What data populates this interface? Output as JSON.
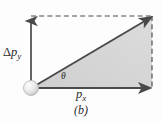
{
  "figure": {
    "caption": "(b)",
    "background_color": "#fdfdfd",
    "width": 162,
    "height": 122
  },
  "labels": {
    "vertical_component": {
      "delta": "Δ",
      "symbol": "p",
      "subscript": "y",
      "full": "Δp_y"
    },
    "horizontal_component": {
      "symbol": "p",
      "subscript": "x",
      "full": "p_x"
    },
    "angle": {
      "symbol": "θ",
      "full": "θ"
    }
  },
  "colors": {
    "triangle_fill": "#d3d3d3",
    "arrow_stroke": "#4a4a4a",
    "dashed_stroke": "#4a4a4a",
    "text": "#2b2b2b",
    "ball_light": "#fbfbfb",
    "ball_mid": "#dcdcdc",
    "ball_edge": "#aaaaaa",
    "background": "#fdfdfd"
  },
  "geometry": {
    "origin": {
      "x": 31,
      "y": 88
    },
    "apex": {
      "x": 152,
      "y": 16
    },
    "corner_right": {
      "x": 152,
      "y": 88
    },
    "corner_top": {
      "x": 31,
      "y": 16
    },
    "ball_radius": 7.5,
    "vertical_arrow": {
      "x1": 31,
      "y1": 88,
      "x2": 31,
      "y2": 17
    },
    "horizontal_arrow": {
      "x1": 31,
      "y1": 88,
      "x2": 150,
      "y2": 88
    },
    "resultant_arrow": {
      "x1": 33,
      "y1": 87,
      "x2": 151,
      "y2": 17
    },
    "dashed_top": {
      "x1": 31,
      "y1": 16,
      "x2": 152,
      "y2": 16
    },
    "dashed_right": {
      "x1": 152,
      "y1": 16,
      "x2": 152,
      "y2": 89
    }
  }
}
